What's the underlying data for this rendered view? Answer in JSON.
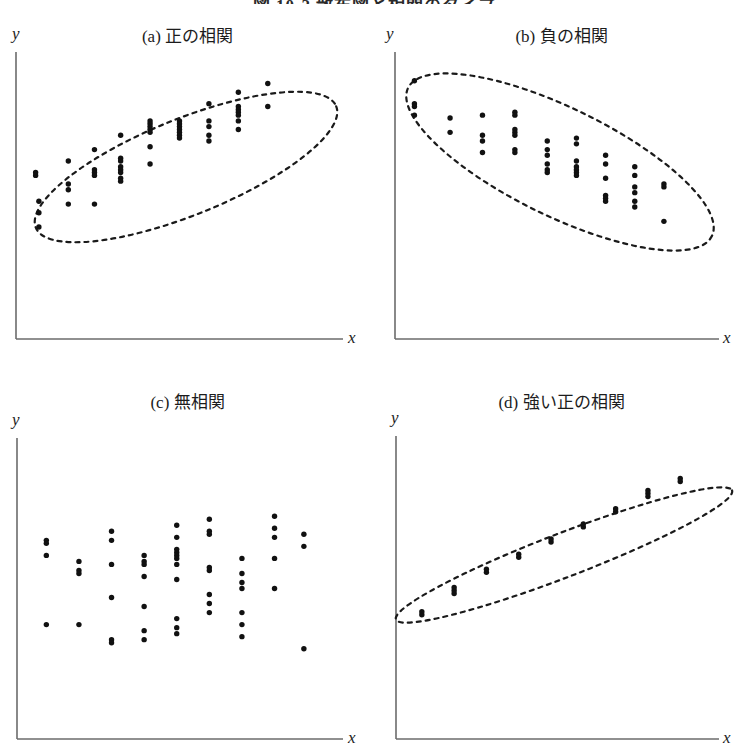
{
  "figure": {
    "title": "図 10-2  散布図と相関のタイプ",
    "title_clipped": true
  },
  "axis_labels": {
    "x": "x",
    "y": "y"
  },
  "panels": [
    {
      "id": "panel-a",
      "label": "(a)  正の相関",
      "key": "positive-correlation",
      "ellipse": true
    },
    {
      "id": "panel-b",
      "label": "(b)  負の相関",
      "key": "negative-correlation",
      "ellipse": true
    },
    {
      "id": "panel-c",
      "label": "(c)  無相関",
      "key": "no-correlation",
      "ellipse": false
    },
    {
      "id": "panel-d",
      "label": "(d)  強い正の相関",
      "key": "strong-positive-correlation",
      "ellipse": true
    }
  ],
  "chart_data": [
    {
      "type": "scatter",
      "panel": "a",
      "title": "(a)  正の相関",
      "xlabel": "x",
      "ylabel": "y",
      "xlim": [
        0,
        100
      ],
      "ylim": [
        0,
        100
      ],
      "grid": false,
      "legend": null,
      "annotation": "dashed ellipse enclosing points, tilted up to the right",
      "ellipse": {
        "cx": 49,
        "cy": 69,
        "rx": 46,
        "ry": 14,
        "rotation": -24
      },
      "points": [
        [
          6,
          57
        ],
        [
          6,
          58
        ],
        [
          7,
          48
        ],
        [
          7,
          44
        ],
        [
          7,
          39
        ],
        [
          16,
          62
        ],
        [
          16,
          54
        ],
        [
          16,
          52
        ],
        [
          16,
          47
        ],
        [
          24,
          66
        ],
        [
          24,
          59
        ],
        [
          24,
          58
        ],
        [
          24,
          57
        ],
        [
          24,
          47
        ],
        [
          32,
          71
        ],
        [
          32,
          63
        ],
        [
          32,
          62
        ],
        [
          32,
          60
        ],
        [
          32,
          59
        ],
        [
          32,
          58
        ],
        [
          32,
          56
        ],
        [
          32,
          55
        ],
        [
          41,
          76
        ],
        [
          41,
          75
        ],
        [
          41,
          74
        ],
        [
          41,
          73
        ],
        [
          41,
          72
        ],
        [
          41,
          67
        ],
        [
          41,
          61
        ],
        [
          50,
          76
        ],
        [
          50,
          75
        ],
        [
          50,
          74
        ],
        [
          50,
          73
        ],
        [
          50,
          72
        ],
        [
          50,
          71
        ],
        [
          50,
          70
        ],
        [
          59,
          82
        ],
        [
          59,
          76
        ],
        [
          59,
          74
        ],
        [
          59,
          71
        ],
        [
          59,
          69
        ],
        [
          68,
          86
        ],
        [
          68,
          81
        ],
        [
          68,
          80
        ],
        [
          68,
          79
        ],
        [
          68,
          78
        ],
        [
          68,
          76
        ],
        [
          68,
          73
        ],
        [
          77,
          89
        ],
        [
          77,
          81
        ]
      ]
    },
    {
      "type": "scatter",
      "panel": "b",
      "title": "(b)  負の相関",
      "xlabel": "x",
      "ylabel": "y",
      "xlim": [
        0,
        100
      ],
      "ylim": [
        0,
        100
      ],
      "grid": false,
      "legend": null,
      "annotation": "dashed ellipse enclosing points, tilted down to the right",
      "ellipse": {
        "cx": 50,
        "cy": 69,
        "rx": 48,
        "ry": 16,
        "rotation": 27
      },
      "points": [
        [
          6,
          90
        ],
        [
          6,
          82
        ],
        [
          6,
          81
        ],
        [
          6,
          78
        ],
        [
          17,
          77
        ],
        [
          17,
          72
        ],
        [
          27,
          78
        ],
        [
          27,
          71
        ],
        [
          27,
          69
        ],
        [
          27,
          65
        ],
        [
          37,
          79
        ],
        [
          37,
          78
        ],
        [
          37,
          73
        ],
        [
          37,
          72
        ],
        [
          37,
          71
        ],
        [
          37,
          66
        ],
        [
          37,
          65
        ],
        [
          47,
          69
        ],
        [
          47,
          66
        ],
        [
          47,
          64
        ],
        [
          47,
          61
        ],
        [
          47,
          59
        ],
        [
          47,
          58
        ],
        [
          56,
          70
        ],
        [
          56,
          68
        ],
        [
          56,
          62
        ],
        [
          56,
          60
        ],
        [
          56,
          59
        ],
        [
          56,
          58
        ],
        [
          56,
          57
        ],
        [
          65,
          64
        ],
        [
          65,
          61
        ],
        [
          65,
          56
        ],
        [
          65,
          50
        ],
        [
          65,
          49
        ],
        [
          65,
          48
        ],
        [
          74,
          60
        ],
        [
          74,
          57
        ],
        [
          74,
          53
        ],
        [
          74,
          51
        ],
        [
          74,
          48
        ],
        [
          74,
          46
        ],
        [
          83,
          54
        ],
        [
          83,
          53
        ],
        [
          83,
          41
        ]
      ]
    },
    {
      "type": "scatter",
      "panel": "c",
      "title": "(c)  無相関",
      "xlabel": "x",
      "ylabel": "y",
      "xlim": [
        0,
        100
      ],
      "ylim": [
        0,
        100
      ],
      "grid": false,
      "legend": null,
      "annotation": "no enclosing ellipse; points scattered with no trend",
      "ellipse": null,
      "points": [
        [
          9,
          66
        ],
        [
          9,
          65
        ],
        [
          9,
          61
        ],
        [
          19,
          59
        ],
        [
          19,
          56
        ],
        [
          19,
          55
        ],
        [
          29,
          69
        ],
        [
          29,
          66
        ],
        [
          29,
          58
        ],
        [
          29,
          47
        ],
        [
          29,
          33
        ],
        [
          29,
          32
        ],
        [
          39,
          61
        ],
        [
          39,
          59
        ],
        [
          39,
          58
        ],
        [
          39,
          54
        ],
        [
          39,
          44
        ],
        [
          39,
          36
        ],
        [
          39,
          33
        ],
        [
          49,
          71
        ],
        [
          49,
          67
        ],
        [
          49,
          63
        ],
        [
          49,
          62
        ],
        [
          49,
          61
        ],
        [
          49,
          60
        ],
        [
          49,
          58
        ],
        [
          49,
          53
        ],
        [
          49,
          40
        ],
        [
          49,
          37
        ],
        [
          49,
          35
        ],
        [
          59,
          73
        ],
        [
          59,
          69
        ],
        [
          59,
          68
        ],
        [
          59,
          57
        ],
        [
          59,
          56
        ],
        [
          59,
          48
        ],
        [
          59,
          45
        ],
        [
          59,
          42
        ],
        [
          69,
          60
        ],
        [
          69,
          55
        ],
        [
          69,
          52
        ],
        [
          69,
          50
        ],
        [
          69,
          42
        ],
        [
          69,
          38
        ],
        [
          69,
          34
        ],
        [
          79,
          74
        ],
        [
          79,
          70
        ],
        [
          79,
          67
        ],
        [
          79,
          60
        ],
        [
          79,
          50
        ],
        [
          88,
          68
        ],
        [
          88,
          64
        ],
        [
          88,
          30
        ],
        [
          9,
          38
        ],
        [
          19,
          38
        ]
      ]
    },
    {
      "type": "scatter",
      "panel": "d",
      "title": "(d)  強い正の相関",
      "xlabel": "x",
      "ylabel": "y",
      "xlim": [
        0,
        100
      ],
      "ylim": [
        0,
        100
      ],
      "grid": false,
      "legend": null,
      "annotation": "narrow dashed ellipse tightly enclosing a near-linear band of points",
      "ellipse": {
        "cx": 50,
        "cy": 62,
        "rx": 52,
        "ry": 6,
        "rotation": -22
      },
      "points": [
        [
          8,
          41
        ],
        [
          8,
          42
        ],
        [
          18,
          48
        ],
        [
          18,
          49
        ],
        [
          18,
          50
        ],
        [
          28,
          55
        ],
        [
          28,
          56
        ],
        [
          38,
          60
        ],
        [
          38,
          61
        ],
        [
          48,
          65
        ],
        [
          48,
          66
        ],
        [
          58,
          70
        ],
        [
          58,
          71
        ],
        [
          68,
          75
        ],
        [
          68,
          76
        ],
        [
          78,
          80
        ],
        [
          78,
          81
        ],
        [
          78,
          82
        ],
        [
          88,
          85
        ],
        [
          88,
          86
        ]
      ]
    }
  ]
}
